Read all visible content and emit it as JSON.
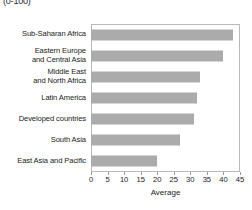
{
  "annotation": {
    "scale_note": "(0-100)"
  },
  "axis": {
    "x_title": "Average",
    "ticks": [
      "0",
      "5",
      "10",
      "15",
      "20",
      "25",
      "30",
      "35",
      "40",
      "45"
    ]
  },
  "colors": {
    "bar_fill": "#ababab",
    "frame": "#b9b9b9",
    "text": "#1a1a1a",
    "background": "#ffffff"
  },
  "chart_data": {
    "type": "bar",
    "orientation": "horizontal",
    "title": "",
    "subtitle": "",
    "annotation": "(0-100)",
    "xlabel": "Average",
    "ylabel": "",
    "xlim": [
      0,
      45
    ],
    "xticks": [
      0,
      5,
      10,
      15,
      20,
      25,
      30,
      35,
      40,
      45
    ],
    "grid": false,
    "legend": false,
    "categories": [
      "Sub-Saharan Africa",
      "Eastern Europe\nand Central Asia",
      "Middle East\nand North Africa",
      "Latin America",
      "Developed countries",
      "South Asia",
      "East Asia and Pacific"
    ],
    "values": [
      43,
      40,
      33,
      32,
      31,
      27,
      20
    ]
  }
}
